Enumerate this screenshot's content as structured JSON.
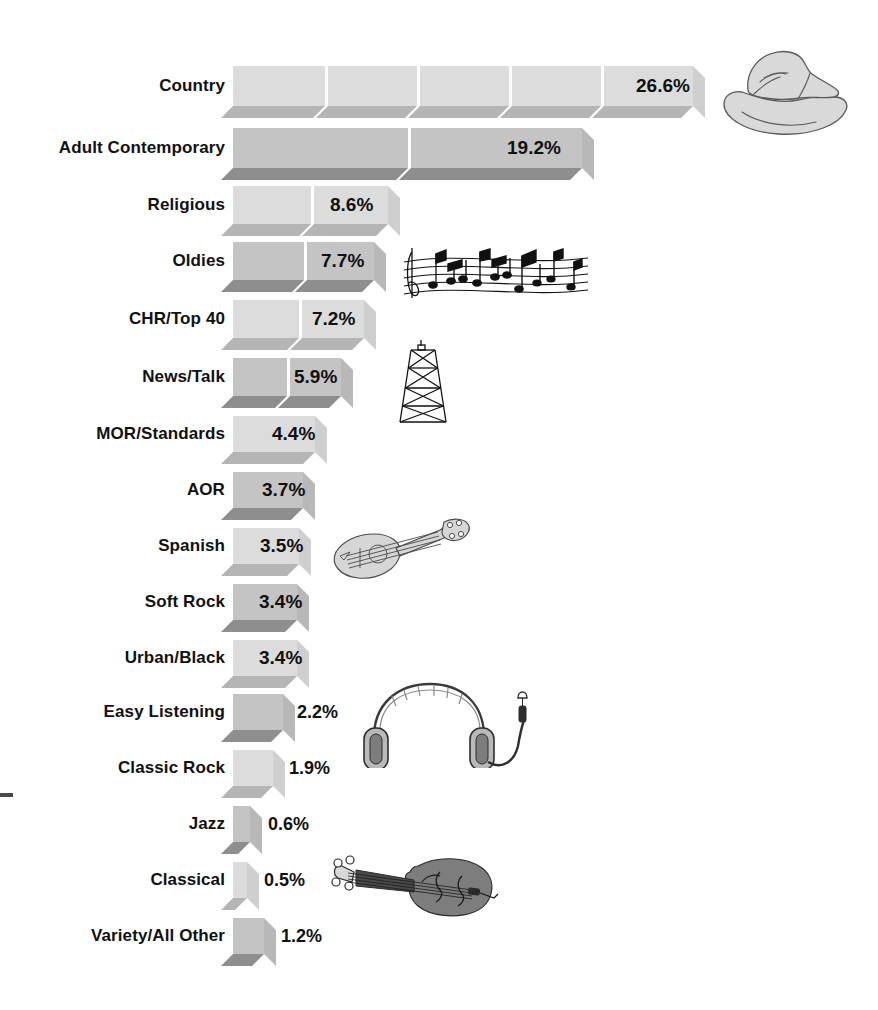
{
  "chart_data": {
    "type": "bar",
    "orientation": "horizontal",
    "title": "",
    "subtitle": "",
    "xlabel": "",
    "ylabel": "",
    "grid": false,
    "legend": "none",
    "xlim": [
      0,
      26.6
    ],
    "value_suffix": "%",
    "categories": [
      "Country",
      "Adult Contemporary",
      "Religious",
      "Oldies",
      "CHR/Top 40",
      "News/Talk",
      "MOR/Standards",
      "AOR",
      "Spanish",
      "Soft Rock",
      "Urban/Black",
      "Easy Listening",
      "Classic Rock",
      "Jazz",
      "Classical",
      "Variety/All Other"
    ],
    "values": [
      26.6,
      19.2,
      8.6,
      7.7,
      7.2,
      5.9,
      4.4,
      3.7,
      3.5,
      3.4,
      3.4,
      2.2,
      1.9,
      0.6,
      0.5,
      1.2
    ],
    "value_labels": [
      "26.6%",
      "19.2%",
      "8.6%",
      "7.7%",
      "7.2%",
      "5.9%",
      "4.4%",
      "3.7%",
      "3.5%",
      "3.4%",
      "3.4%",
      "2.2%",
      "1.9%",
      "0.6%",
      "0.5%",
      "1.2%"
    ]
  },
  "rows": [
    {
      "label": "Country",
      "value_label": "26.6%",
      "value": 26.6,
      "y": 66,
      "h": 40,
      "bar_w": 460,
      "shade": "light",
      "segments": 5,
      "label_inside": true,
      "label_x": 636
    },
    {
      "label": "Adult Contemporary",
      "value_label": "19.2%",
      "value": 19.2,
      "y": 128,
      "h": 40,
      "bar_w": 349,
      "shade": "dark",
      "segments": 2,
      "label_inside": true,
      "label_x": 507
    },
    {
      "label": "Religious",
      "value_label": "8.6%",
      "value": 8.6,
      "y": 186,
      "h": 38,
      "bar_w": 155,
      "shade": "light",
      "segments": 2,
      "label_inside": true,
      "label_x": 330
    },
    {
      "label": "Oldies",
      "value_label": "7.7%",
      "value": 7.7,
      "y": 242,
      "h": 38,
      "bar_w": 141,
      "shade": "dark",
      "segments": 2,
      "label_inside": true,
      "label_x": 321
    },
    {
      "label": "CHR/Top 40",
      "value_label": "7.2%",
      "value": 7.2,
      "y": 300,
      "h": 38,
      "bar_w": 131,
      "shade": "light",
      "segments": 2,
      "label_inside": true,
      "label_x": 312
    },
    {
      "label": "News/Talk",
      "value_label": "5.9%",
      "value": 5.9,
      "y": 358,
      "h": 38,
      "bar_w": 108,
      "shade": "dark",
      "segments": 2,
      "label_inside": true,
      "label_x": 294
    },
    {
      "label": "MOR/Standards",
      "value_label": "4.4%",
      "value": 4.4,
      "y": 416,
      "h": 36,
      "bar_w": 82,
      "shade": "light",
      "segments": 1,
      "label_inside": true,
      "label_x": 272
    },
    {
      "label": "AOR",
      "value_label": "3.7%",
      "value": 3.7,
      "y": 472,
      "h": 36,
      "bar_w": 70,
      "shade": "dark",
      "segments": 1,
      "label_inside": true,
      "label_x": 262
    },
    {
      "label": "Spanish",
      "value_label": "3.5%",
      "value": 3.5,
      "y": 528,
      "h": 36,
      "bar_w": 66,
      "shade": "light",
      "segments": 1,
      "label_inside": true,
      "label_x": 260
    },
    {
      "label": "Soft Rock",
      "value_label": "3.4%",
      "value": 3.4,
      "y": 584,
      "h": 36,
      "bar_w": 64,
      "shade": "dark",
      "segments": 1,
      "label_inside": true,
      "label_x": 259
    },
    {
      "label": "Urban/Black",
      "value_label": "3.4%",
      "value": 3.4,
      "y": 640,
      "h": 36,
      "bar_w": 64,
      "shade": "light",
      "segments": 1,
      "label_inside": true,
      "label_x": 259
    },
    {
      "label": "Easy Listening",
      "value_label": "2.2%",
      "value": 2.2,
      "y": 694,
      "h": 36,
      "bar_w": 50,
      "shade": "dark",
      "segments": 1,
      "label_inside": false,
      "label_x": 297
    },
    {
      "label": "Classic Rock",
      "value_label": "1.9%",
      "value": 1.9,
      "y": 750,
      "h": 36,
      "bar_w": 40,
      "shade": "light",
      "segments": 1,
      "label_inside": false,
      "label_x": 289
    },
    {
      "label": "Jazz",
      "value_label": "0.6%",
      "value": 0.6,
      "y": 806,
      "h": 36,
      "bar_w": 17,
      "shade": "dark",
      "segments": 1,
      "label_inside": false,
      "label_x": 268
    },
    {
      "label": "Classical",
      "value_label": "0.5%",
      "value": 0.5,
      "y": 862,
      "h": 36,
      "bar_w": 14,
      "shade": "light",
      "segments": 1,
      "label_inside": false,
      "label_x": 264
    },
    {
      "label": "Variety/All Other",
      "value_label": "1.2%",
      "value": 1.2,
      "y": 918,
      "h": 36,
      "bar_w": 31,
      "shade": "dark",
      "segments": 1,
      "label_inside": false,
      "label_x": 281
    }
  ],
  "illustrations": [
    {
      "name": "cowboy-hat-illustration",
      "x": 712,
      "y": 42,
      "w": 140,
      "h": 100
    },
    {
      "name": "music-staff-illustration",
      "x": 398,
      "y": 236,
      "w": 195,
      "h": 78
    },
    {
      "name": "radio-tower-illustration",
      "x": 392,
      "y": 336,
      "w": 62,
      "h": 90
    },
    {
      "name": "mandolin-illustration",
      "x": 326,
      "y": 512,
      "w": 146,
      "h": 72
    },
    {
      "name": "headphones-illustration",
      "x": 352,
      "y": 676,
      "w": 186,
      "h": 92
    },
    {
      "name": "violin-illustration",
      "x": 322,
      "y": 846,
      "w": 196,
      "h": 76
    }
  ],
  "axis_tick": {
    "name": "left-axis-tick",
    "x": 0,
    "y": 793,
    "w": 13,
    "h": 4
  },
  "style": {
    "bar_origin_x": 233,
    "label_right_edge": 225,
    "depth": 12,
    "face_light": "#dcdcdc",
    "face_dark": "#c4c4c4",
    "bottom_light": "#b5b5b5",
    "bottom_dark": "#8e8e8e",
    "side_light": "#cfcfcf",
    "side_dark": "#b8b8b8",
    "text_color": "#111111",
    "background": "#ffffff"
  }
}
